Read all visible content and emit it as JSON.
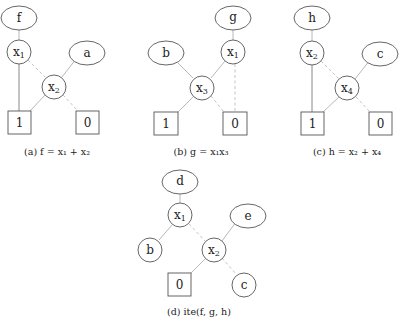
{
  "figure": {
    "panels": [
      {
        "id": "a",
        "caption": "(a) f = x₁ + x₂",
        "nodes": [
          {
            "id": "f",
            "label": "f",
            "shape": "ellipse"
          },
          {
            "id": "x1",
            "label": "x₁",
            "shape": "circle"
          },
          {
            "id": "a",
            "label": "a",
            "shape": "ellipse"
          },
          {
            "id": "x2",
            "label": "x₂",
            "shape": "circle"
          },
          {
            "id": "one",
            "label": "1",
            "shape": "square"
          },
          {
            "id": "zero",
            "label": "0",
            "shape": "square"
          }
        ],
        "edges": [
          {
            "from": "f",
            "to": "x1",
            "style": "solid"
          },
          {
            "from": "x1",
            "to": "one",
            "style": "solid"
          },
          {
            "from": "x1",
            "to": "x2",
            "style": "dashed"
          },
          {
            "from": "a",
            "to": "x2",
            "style": "solid"
          },
          {
            "from": "x2",
            "to": "one",
            "style": "solid"
          },
          {
            "from": "x2",
            "to": "zero",
            "style": "dashed"
          }
        ]
      },
      {
        "id": "b",
        "caption": "(b) g = x₁x₃",
        "nodes": [
          {
            "id": "g",
            "label": "g",
            "shape": "ellipse"
          },
          {
            "id": "b",
            "label": "b",
            "shape": "ellipse"
          },
          {
            "id": "x1",
            "label": "x₁",
            "shape": "circle"
          },
          {
            "id": "x3",
            "label": "x₃",
            "shape": "circle"
          },
          {
            "id": "one",
            "label": "1",
            "shape": "square"
          },
          {
            "id": "zero",
            "label": "0",
            "shape": "square"
          }
        ],
        "edges": [
          {
            "from": "g",
            "to": "x1",
            "style": "solid"
          },
          {
            "from": "x1",
            "to": "x3",
            "style": "solid"
          },
          {
            "from": "x1",
            "to": "zero",
            "style": "dashed"
          },
          {
            "from": "b",
            "to": "x3",
            "style": "solid"
          },
          {
            "from": "x3",
            "to": "one",
            "style": "solid"
          },
          {
            "from": "x3",
            "to": "zero",
            "style": "dashed"
          }
        ]
      },
      {
        "id": "c",
        "caption": "(c) h = x₂ + x₄",
        "nodes": [
          {
            "id": "h",
            "label": "h",
            "shape": "ellipse"
          },
          {
            "id": "x2",
            "label": "x₂",
            "shape": "circle"
          },
          {
            "id": "c",
            "label": "c",
            "shape": "ellipse"
          },
          {
            "id": "x4",
            "label": "x₄",
            "shape": "circle"
          },
          {
            "id": "one",
            "label": "1",
            "shape": "square"
          },
          {
            "id": "zero",
            "label": "0",
            "shape": "square"
          }
        ],
        "edges": [
          {
            "from": "h",
            "to": "x2",
            "style": "solid"
          },
          {
            "from": "x2",
            "to": "one",
            "style": "solid"
          },
          {
            "from": "x2",
            "to": "x4",
            "style": "dashed"
          },
          {
            "from": "c",
            "to": "x4",
            "style": "solid"
          },
          {
            "from": "x4",
            "to": "one",
            "style": "solid"
          },
          {
            "from": "x4",
            "to": "zero",
            "style": "dashed"
          }
        ]
      },
      {
        "id": "d",
        "caption": "(d) ite(f, g, h)",
        "nodes": [
          {
            "id": "d",
            "label": "d",
            "shape": "ellipse"
          },
          {
            "id": "x1",
            "label": "x₁",
            "shape": "circle"
          },
          {
            "id": "e",
            "label": "e",
            "shape": "ellipse"
          },
          {
            "id": "b",
            "label": "b",
            "shape": "circle"
          },
          {
            "id": "x2",
            "label": "x₂",
            "shape": "circle"
          },
          {
            "id": "zero",
            "label": "0",
            "shape": "square"
          },
          {
            "id": "c",
            "label": "c",
            "shape": "circle"
          }
        ],
        "edges": [
          {
            "from": "d",
            "to": "x1",
            "style": "solid"
          },
          {
            "from": "x1",
            "to": "b",
            "style": "solid"
          },
          {
            "from": "x1",
            "to": "x2",
            "style": "dashed"
          },
          {
            "from": "e",
            "to": "x2",
            "style": "solid"
          },
          {
            "from": "x2",
            "to": "zero",
            "style": "solid"
          },
          {
            "from": "x2",
            "to": "c",
            "style": "dashed"
          }
        ]
      }
    ]
  },
  "labels": {
    "a": {
      "f": "f",
      "x1": "x",
      "x1s": "1",
      "a": "a",
      "x2": "x",
      "x2s": "2",
      "one": "1",
      "zero": "0",
      "caption": "(a) f = x₁ + x₂"
    },
    "b": {
      "g": "g",
      "b": "b",
      "x1": "x",
      "x1s": "1",
      "x3": "x",
      "x3s": "3",
      "one": "1",
      "zero": "0",
      "caption": "(b) g = x₁x₃"
    },
    "c": {
      "h": "h",
      "x2": "x",
      "x2s": "2",
      "c": "c",
      "x4": "x",
      "x4s": "4",
      "one": "1",
      "zero": "0",
      "caption": "(c) h = x₂ + x₄"
    },
    "d": {
      "d": "d",
      "x1": "x",
      "x1s": "1",
      "e": "e",
      "b": "b",
      "x2": "x",
      "x2s": "2",
      "zero": "0",
      "c": "c",
      "caption": "(d) ite(f, g, h)"
    }
  }
}
